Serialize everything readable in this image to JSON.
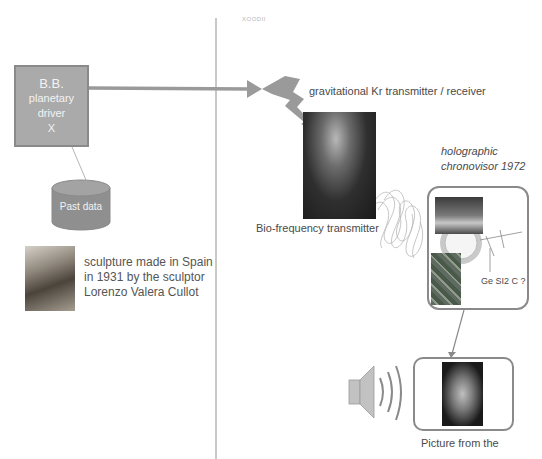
{
  "watermark": "XOODII",
  "driver": {
    "line1": "B.B.",
    "line2": "planetary",
    "line3": "driver",
    "line4": "X"
  },
  "database": {
    "label": "Past data"
  },
  "sculpture": {
    "image_alt": "sculpture photo",
    "caption_lines": [
      "sculpture made in Spain",
      "in 1931 by the sculptor",
      "Lorenzo Valera Cullot"
    ]
  },
  "transmitter": {
    "label": "gravitational Kr transmitter / receiver"
  },
  "bio": {
    "label": "Bio-frequency transmitter"
  },
  "chronovisor": {
    "title_lines": [
      "holographic",
      "chronovisor 1972"
    ],
    "antenna_label": "Ge SI2 C ?"
  },
  "output": {
    "label": "Picture from the"
  },
  "colors": {
    "box_fill": "#aaaaaa",
    "box_border": "#8a8a8a",
    "arrow": "#9a9a9a",
    "divider": "#c9c9c9",
    "text": "#4a4a4a"
  }
}
